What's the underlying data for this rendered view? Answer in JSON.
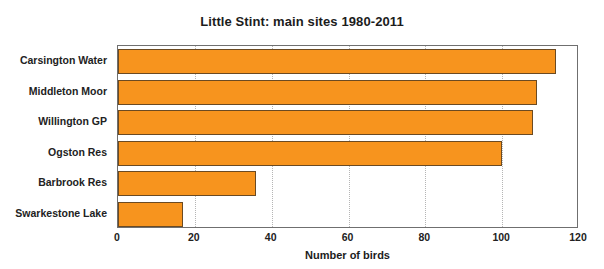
{
  "chart_data": {
    "type": "bar",
    "orientation": "horizontal",
    "title": "Little Stint: main sites 1980-2011",
    "xlabel": "Number of birds",
    "ylabel": "",
    "categories": [
      "Carsington Water",
      "Middleton Moor",
      "Willington GP",
      "Ogston Res",
      "Barbrook Res",
      "Swarkestone Lake"
    ],
    "values": [
      114,
      109,
      108,
      100,
      36,
      17
    ],
    "xlim": [
      0,
      120
    ],
    "xticks": [
      0,
      20,
      40,
      60,
      80,
      100,
      120
    ],
    "xticklabels": [
      "0",
      "20",
      "40",
      "60",
      "80",
      "100",
      "120"
    ],
    "grid": "vertical-dotted",
    "legend": "none",
    "colors": {
      "bar_fill": "#f7941e",
      "bar_border": "#6b4a22",
      "axis": "#6f6f6f",
      "gridline": "#b5b5b5",
      "text": "#222222",
      "background": "#ffffff"
    }
  }
}
